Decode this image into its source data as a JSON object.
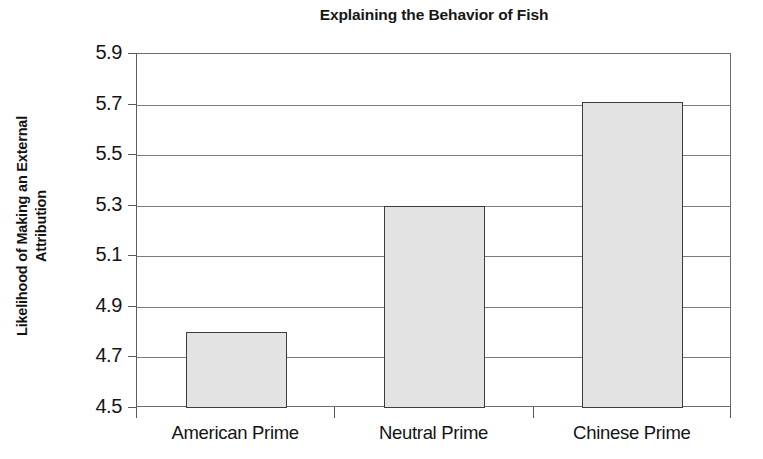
{
  "chart_data": {
    "type": "bar",
    "title": "Explaining the Behavior of Fish",
    "xlabel": "",
    "ylabel": "Likelihood of Making an External Attribution",
    "ylabel_lines": [
      "Likelihood of Making an External",
      "Attribution"
    ],
    "categories": [
      "American Prime",
      "Neutral Prime",
      "Chinese Prime"
    ],
    "values": [
      4.8,
      5.3,
      5.71
    ],
    "ylim": [
      4.5,
      5.9
    ],
    "ytick_step": 0.2,
    "ytick_labels": [
      "5.9",
      "5.7",
      "5.5",
      "5.3",
      "5.1",
      "4.9",
      "4.7",
      "4.5"
    ],
    "ytick_values": [
      5.9,
      5.7,
      5.5,
      5.3,
      5.1,
      4.9,
      4.7,
      4.5
    ],
    "grid": true,
    "legend": false,
    "legend_position": "none",
    "bar_fill_color": "#e3e3e3",
    "bar_edge_color": "#3d3d3d",
    "plot_background": "#ffffff",
    "gridline_color": "#7b7b7b",
    "axis_color": "#5a5a5a"
  }
}
